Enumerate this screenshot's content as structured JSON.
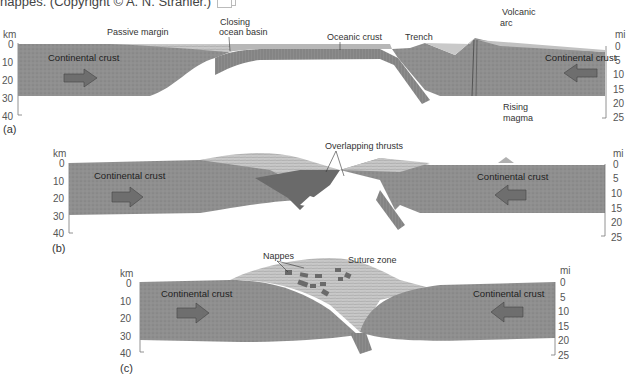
{
  "caption": {
    "text": "nappes. (Copyright © A. N. Strahler.)",
    "icon": "image-icon"
  },
  "colors": {
    "continental_crust": "#8f8f8f",
    "oceanic_crust": "#8a8a8a",
    "sediment": "#c4c4c4",
    "arrow_fill": "#6e6e6e",
    "background": "#ffffff",
    "text": "#333333"
  },
  "axes": {
    "left_unit": "km",
    "left_ticks": [
      "0",
      "10",
      "20",
      "30",
      "40"
    ],
    "right_unit": "mi",
    "right_ticks": [
      "0",
      "5",
      "10",
      "15",
      "20",
      "25"
    ]
  },
  "panels": [
    {
      "id": "a",
      "label": "(a)",
      "annotations": {
        "passive_margin": "Passive margin",
        "closing_ocean_basin_1": "Closing",
        "closing_ocean_basin_2": "ocean basin",
        "oceanic_crust": "Oceanic crust",
        "trench": "Trench",
        "volcanic_arc_1": "Volcanic",
        "volcanic_arc_2": "arc",
        "rising_magma_1": "Rising",
        "rising_magma_2": "magma"
      },
      "left_crust": "Continental crust",
      "right_crust": "Continental crust",
      "left_arrow": "arrow-right-icon",
      "right_arrow": "arrow-left-icon"
    },
    {
      "id": "b",
      "label": "(b)",
      "annotations": {
        "overlapping_thrusts": "Overlapping thrusts"
      },
      "left_crust": "Continental crust",
      "right_crust": "Continental crust",
      "left_arrow": "arrow-right-icon",
      "right_arrow": "arrow-left-icon"
    },
    {
      "id": "c",
      "label": "(c)",
      "annotations": {
        "nappes": "Nappes",
        "suture_zone": "Suture zone"
      },
      "left_crust": "Continental crust",
      "right_crust": "Continental crust",
      "left_arrow": "arrow-right-icon",
      "right_arrow": "arrow-left-icon"
    }
  ]
}
